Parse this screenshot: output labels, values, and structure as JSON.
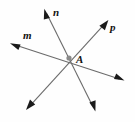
{
  "figure": {
    "type": "geometry-diagram",
    "background_color": "#fefefe",
    "line_color": "#6b6b6b",
    "arrow_color": "#1a1a1a",
    "vertex_color": "#8a8a8a",
    "label_color": "#111111",
    "width": 135,
    "height": 122,
    "vertex": {
      "name": "A",
      "label": "A",
      "x": 69,
      "y": 58,
      "radius": 2.6
    },
    "lines": [
      {
        "id": "m",
        "label": "m",
        "label_x": 23,
        "label_y": 30,
        "x1": 12,
        "y1": 44,
        "x2": 123,
        "y2": 80,
        "arrow_start": true,
        "arrow_end": true
      },
      {
        "id": "n",
        "label": "n",
        "label_x": 53,
        "label_y": 7,
        "x1": 45,
        "y1": 10,
        "x2": 95,
        "y2": 111,
        "arrow_start": true,
        "arrow_end": true
      },
      {
        "id": "p",
        "label": "p",
        "label_x": 110,
        "label_y": 22,
        "x1": 107,
        "y1": 21,
        "x2": 27,
        "y2": 109,
        "arrow_start": true,
        "arrow_end": true
      }
    ],
    "labels": {
      "m": "m",
      "n": "n",
      "p": "p",
      "A": "A"
    }
  }
}
